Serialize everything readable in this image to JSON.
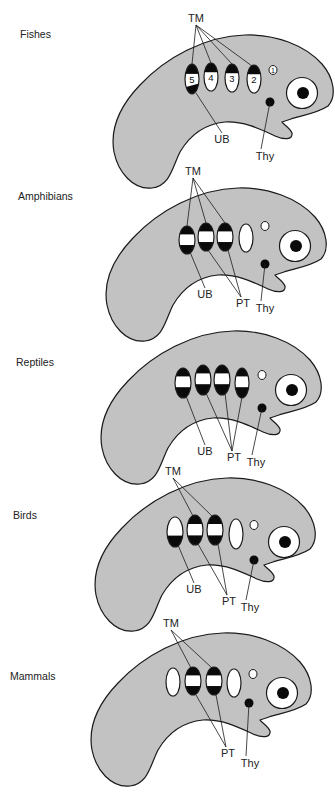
{
  "colors": {
    "body_fill": "#c2c2c2",
    "outline": "#1a1a1a",
    "pouch_white": "#ffffff",
    "pouch_dark": "#0a0a0a"
  },
  "labels": {
    "tm": "TM",
    "ub": "UB",
    "pt": "PT",
    "thy": "Thy"
  },
  "panels": [
    {
      "group": "Fishes",
      "label_pos": [
        20,
        30
      ],
      "offset": [
        0,
        0
      ],
      "pouches": [
        {
          "num": "5",
          "cx": 192,
          "cy": 79,
          "rx": 7,
          "ry": 15,
          "pattern": "top-bottom-dark"
        },
        {
          "num": "4",
          "cx": 211,
          "cy": 77,
          "rx": 7,
          "ry": 14,
          "pattern": "top-dark"
        },
        {
          "num": "3",
          "cx": 232,
          "cy": 78,
          "rx": 7,
          "ry": 14,
          "pattern": "top-dark"
        },
        {
          "num": "2",
          "cx": 254,
          "cy": 79,
          "rx": 7,
          "ry": 14,
          "pattern": "top-dark"
        }
      ],
      "small_pouch": {
        "num": "1",
        "cx": 273,
        "cy": 70,
        "r": 4
      },
      "thyroid": [
        270,
        102
      ],
      "eye": [
        302,
        93
      ],
      "tm_label": [
        196,
        22
      ],
      "tm_targets": [
        [
          192,
          64
        ],
        [
          211,
          63
        ],
        [
          232,
          64
        ],
        [
          252,
          66
        ]
      ],
      "ub_label": [
        222,
        143
      ],
      "ub_from": [
        196,
        93
      ],
      "pt_label": null,
      "pt_from": [],
      "thy_label": [
        265,
        160
      ]
    },
    {
      "group": "Amphibians",
      "label_pos": [
        18,
        192
      ],
      "offset": [
        -7,
        153
      ],
      "pouches": [
        {
          "num": "",
          "cx": 187,
          "cy": 240,
          "rx": 8,
          "ry": 14,
          "pattern": "band"
        },
        {
          "num": "",
          "cx": 206,
          "cy": 237,
          "rx": 8,
          "ry": 14,
          "pattern": "band"
        },
        {
          "num": "",
          "cx": 225,
          "cy": 237,
          "rx": 8,
          "ry": 14,
          "pattern": "band"
        },
        {
          "num": "",
          "cx": 246,
          "cy": 238,
          "rx": 7,
          "ry": 14,
          "pattern": "white"
        }
      ],
      "small_pouch": {
        "num": "",
        "cx": 265,
        "cy": 226,
        "r": 4
      },
      "thyroid": [
        265,
        264
      ],
      "eye": [
        295,
        246
      ],
      "tm_label": [
        193,
        175
      ],
      "tm_targets": [
        [
          187,
          226
        ],
        [
          206,
          223
        ],
        [
          225,
          223
        ]
      ],
      "ub_label": [
        205,
        298
      ],
      "ub_from": [
        190,
        252
      ],
      "pt_label": [
        243,
        307
      ],
      "pt_from": [
        [
          208,
          250
        ],
        [
          228,
          250
        ]
      ],
      "thy_label": [
        265,
        312
      ]
    },
    {
      "group": "Reptiles",
      "label_pos": [
        16,
        358
      ],
      "offset": [
        -12,
        296
      ],
      "pouches": [
        {
          "num": "",
          "cx": 183,
          "cy": 383,
          "rx": 8,
          "ry": 15,
          "pattern": "band-low"
        },
        {
          "num": "",
          "cx": 203,
          "cy": 380,
          "rx": 8,
          "ry": 15,
          "pattern": "band-low"
        },
        {
          "num": "",
          "cx": 222,
          "cy": 380,
          "rx": 8,
          "ry": 15,
          "pattern": "band-low"
        },
        {
          "num": "",
          "cx": 242,
          "cy": 383,
          "rx": 7,
          "ry": 15,
          "pattern": "band-low"
        }
      ],
      "small_pouch": {
        "num": "",
        "cx": 262,
        "cy": 375,
        "r": 4
      },
      "thyroid": [
        262,
        408
      ],
      "eye": [
        291,
        390
      ],
      "tm_label": null,
      "tm_targets": [],
      "ub_label": [
        205,
        455
      ],
      "ub_from": [
        186,
        396
      ],
      "pt_label": [
        234,
        461
      ],
      "pt_from": [
        [
          206,
          393
        ],
        [
          225,
          393
        ],
        [
          242,
          397
        ]
      ],
      "thy_label": [
        256,
        466
      ]
    },
    {
      "group": "Birds",
      "label_pos": [
        13,
        511
      ],
      "offset": [
        -18,
        443
      ],
      "pouches": [
        {
          "num": "",
          "cx": 175,
          "cy": 532,
          "rx": 8,
          "ry": 15,
          "pattern": "bottom-dark"
        },
        {
          "num": "",
          "cx": 195,
          "cy": 530,
          "rx": 8,
          "ry": 15,
          "pattern": "band"
        },
        {
          "num": "",
          "cx": 215,
          "cy": 530,
          "rx": 8,
          "ry": 15,
          "pattern": "band"
        },
        {
          "num": "",
          "cx": 236,
          "cy": 534,
          "rx": 7,
          "ry": 15,
          "pattern": "white"
        }
      ],
      "small_pouch": {
        "num": "",
        "cx": 254,
        "cy": 525,
        "r": 4
      },
      "thyroid": [
        254,
        560
      ],
      "eye": [
        284,
        542
      ],
      "tm_label": [
        173,
        475
      ],
      "tm_targets": [
        [
          193,
          516
        ],
        [
          212,
          516
        ]
      ],
      "ub_label": [
        194,
        593
      ],
      "ub_from": [
        178,
        545
      ],
      "pt_label": [
        229,
        605
      ],
      "pt_from": [
        [
          198,
          544
        ],
        [
          218,
          544
        ]
      ],
      "thy_label": [
        250,
        611
      ]
    },
    {
      "group": "Mammals",
      "label_pos": [
        10,
        672
      ],
      "offset": [
        -22,
        598
      ],
      "pouches": [
        {
          "num": "",
          "cx": 173,
          "cy": 682,
          "rx": 7,
          "ry": 14,
          "pattern": "white"
        },
        {
          "num": "",
          "cx": 193,
          "cy": 681,
          "rx": 8,
          "ry": 14,
          "pattern": "band"
        },
        {
          "num": "",
          "cx": 214,
          "cy": 681,
          "rx": 8,
          "ry": 14,
          "pattern": "band"
        },
        {
          "num": "",
          "cx": 234,
          "cy": 683,
          "rx": 7,
          "ry": 14,
          "pattern": "white"
        }
      ],
      "small_pouch": {
        "num": "",
        "cx": 253,
        "cy": 674,
        "r": 4
      },
      "thyroid": [
        249,
        703
      ],
      "eye": [
        282,
        693
      ],
      "tm_label": [
        171,
        627
      ],
      "tm_targets": [
        [
          191,
          668
        ],
        [
          212,
          668
        ]
      ],
      "ub_label": null,
      "ub_from": null,
      "pt_label": [
        228,
        757
      ],
      "pt_from": [
        [
          196,
          695
        ],
        [
          216,
          695
        ]
      ],
      "thy_label": [
        250,
        767
      ]
    }
  ]
}
